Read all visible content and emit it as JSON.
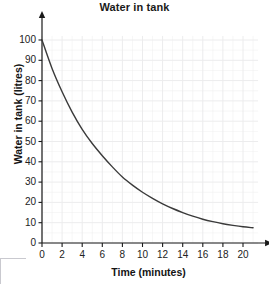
{
  "chart_data": {
    "type": "line",
    "title": "Water in tank",
    "xlabel": "Time (minutes)",
    "ylabel": "Water in tank (litres)",
    "xlim": [
      0,
      21.5
    ],
    "ylim": [
      0,
      102
    ],
    "xticks": [
      0,
      2,
      4,
      6,
      8,
      10,
      12,
      14,
      16,
      18,
      20
    ],
    "yticks": [
      0,
      10,
      20,
      30,
      40,
      50,
      60,
      70,
      80,
      90,
      100
    ],
    "grid": true,
    "grid_color": "#ececed",
    "legend": false,
    "line_color": "#3a3a3a",
    "axis_color": "#1a1a1a",
    "series": [
      {
        "name": "Water in tank",
        "x": [
          0,
          1,
          2,
          3,
          4,
          5,
          6,
          7,
          8,
          9,
          10,
          11,
          12,
          13,
          14,
          15,
          16,
          17,
          18,
          19,
          20,
          21
        ],
        "values": [
          100,
          86.0,
          74.5,
          64.5,
          56.0,
          49.0,
          43.0,
          37.5,
          32.5,
          28.5,
          25.0,
          22.0,
          19.3,
          17.0,
          15.0,
          13.2,
          11.7,
          10.5,
          9.5,
          8.7,
          8.0,
          7.5
        ]
      }
    ],
    "annotations": []
  }
}
